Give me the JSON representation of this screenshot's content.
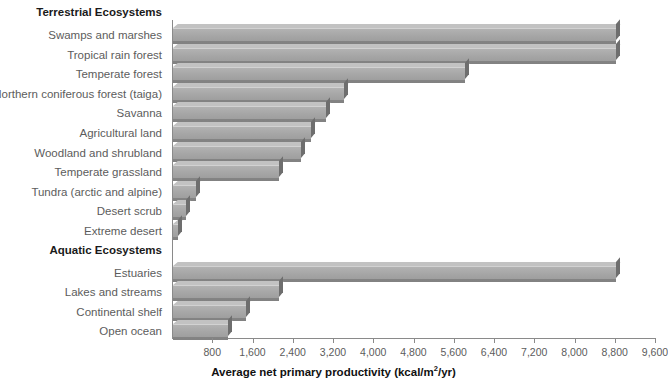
{
  "chart_data": {
    "type": "bar",
    "orientation": "horizontal",
    "title": "",
    "xlabel": "Average net primary productivity (kcal/m2/yr)",
    "xlabel_prefix": "Average net primary productivity (kcal/m",
    "xlabel_sup": "2",
    "xlabel_suffix": "/yr)",
    "ylabel": "",
    "xlim": [
      0,
      9600
    ],
    "xticks": [
      800,
      1600,
      2400,
      3200,
      4000,
      4800,
      5600,
      6400,
      7200,
      8000,
      8800,
      9600
    ],
    "xtick_labels": [
      "800",
      "1,600",
      "2,400",
      "3,200",
      "4,000",
      "4,800",
      "5,600",
      "6,400",
      "7,200",
      "8,000",
      "8,800",
      "9,600"
    ],
    "grid": false,
    "legend": "none",
    "bar_color": "#a6a6a6",
    "bar_edge_color": "#6e6e6e",
    "groups": [
      {
        "heading": "Terrestrial Ecosystems",
        "categories": [
          "Swamps and marshes",
          "Tropical rain forest",
          "Temperate forest",
          "Northern coniferous forest (taiga)",
          "Savanna",
          "Agricultural land",
          "Woodland and shrubland",
          "Temperate grassland",
          "Tundra (arctic and alpine)",
          "Desert scrub",
          "Extreme desert"
        ],
        "values": [
          8800,
          8800,
          5800,
          3400,
          3050,
          2750,
          2550,
          2100,
          450,
          250,
          100
        ]
      },
      {
        "heading": "Aquatic Ecosystems",
        "categories": [
          "Estuaries",
          "Lakes and streams",
          "Continental shelf",
          "Open ocean"
        ],
        "values": [
          8800,
          2100,
          1450,
          1100
        ]
      }
    ]
  }
}
